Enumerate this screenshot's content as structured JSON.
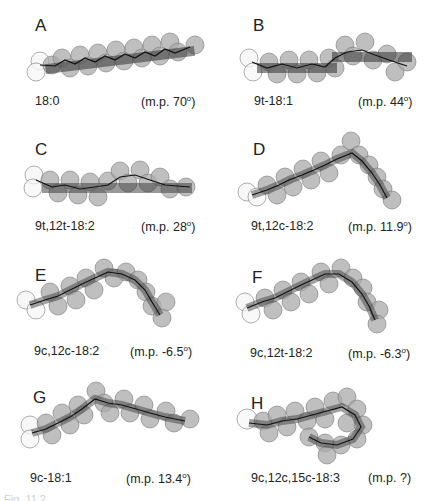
{
  "panels": [
    {
      "letter": "A",
      "name": "18:0",
      "mp_prefix": "(m.p. 70",
      "mp_suffix": ")"
    },
    {
      "letter": "B",
      "name": "9t-18:1",
      "mp_prefix": "(m.p. 44",
      "mp_suffix": ")"
    },
    {
      "letter": "C",
      "name": "9t,12t-18:2",
      "mp_prefix": "(m.p. 28",
      "mp_suffix": ")"
    },
    {
      "letter": "D",
      "name": "9t,12c-18:2",
      "mp_prefix": "(m.p. 11.9",
      "mp_suffix": ")"
    },
    {
      "letter": "E",
      "name": "9c,12c-18:2",
      "mp_prefix": "(m.p. -6.5",
      "mp_suffix": ")"
    },
    {
      "letter": "F",
      "name": "9c,12t-18:2",
      "mp_prefix": "(m.p. -6.3",
      "mp_suffix": ")"
    },
    {
      "letter": "G",
      "name": "9c-18:1",
      "mp_prefix": "(m.p. 13.4",
      "mp_suffix": ")"
    },
    {
      "letter": "H",
      "name": "9c,12c,15c-18:3",
      "mp_prefix": "(m.p. ?",
      "mp_suffix": ")"
    }
  ],
  "degree_symbol": "o",
  "caption": "Fig. 11.2"
}
